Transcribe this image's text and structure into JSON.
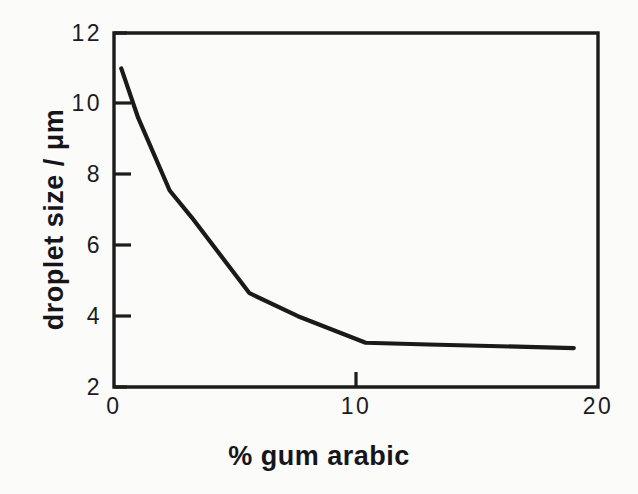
{
  "chart_data": {
    "type": "line",
    "title": "",
    "subtitle": "",
    "xlabel": "% gum arabic",
    "ylabel": "droplet size / μm",
    "xlim": [
      0,
      20
    ],
    "ylim": [
      2,
      12
    ],
    "xticks": [
      0,
      10,
      20
    ],
    "xtick_labels": [
      "0",
      "10",
      "20"
    ],
    "yticks": [
      2,
      4,
      6,
      8,
      10,
      12
    ],
    "ytick_labels": [
      "2",
      "4",
      "6",
      "8",
      "10",
      "12"
    ],
    "grid": false,
    "legend": null,
    "line_color": "#1a1a1a",
    "series": [
      {
        "name": "droplet size",
        "x": [
          0.3,
          1.0,
          2.3,
          3.2,
          5.6,
          7.6,
          10.4,
          13.0,
          19.0
        ],
        "values": [
          11.0,
          9.6,
          7.55,
          6.8,
          4.65,
          4.0,
          3.25,
          3.2,
          3.1
        ]
      }
    ]
  },
  "axes": {
    "xlabel": "% gum arabic",
    "ylabel": "droplet size / μm",
    "xtick_labels": [
      "0",
      "10",
      "20"
    ],
    "ytick_labels": [
      "12",
      "10",
      "8",
      "6",
      "4",
      "2"
    ]
  },
  "colors": {
    "background": "#fbfbfa",
    "ink": "#1a1a1a",
    "frame": "#1c1c1c"
  }
}
